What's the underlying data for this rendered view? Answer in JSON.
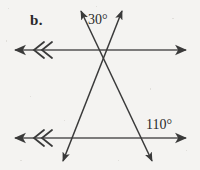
{
  "figure": {
    "part_label": "b.",
    "background_color": "#f4f3f1",
    "ink_color": "#3a3a3a",
    "labels": {
      "angle_top": "30°",
      "angle_bottom": "110°"
    },
    "geometry": {
      "type": "parallel-lines-with-two-transversals",
      "parallel_lines": [
        {
          "name": "top-parallel-line",
          "y": 50,
          "x_start": 13,
          "x_end": 188,
          "left_arrow": true,
          "right_arrow": true,
          "tick_marks": 2
        },
        {
          "name": "bottom-parallel-line",
          "y": 138,
          "x_start": 13,
          "x_end": 188,
          "left_arrow": true,
          "right_arrow": true,
          "tick_marks": 2
        }
      ],
      "transversals": [
        {
          "name": "left-leaning-transversal",
          "x1": 123,
          "y1": 9,
          "x2": 62,
          "y2": 163,
          "start_arrow": true,
          "end_arrow": true
        },
        {
          "name": "right-leaning-transversal",
          "x1": 80,
          "y1": 9,
          "x2": 153,
          "y2": 163,
          "start_arrow": true,
          "end_arrow": true
        }
      ],
      "vertex": {
        "x": 101,
        "y": 50
      }
    }
  }
}
